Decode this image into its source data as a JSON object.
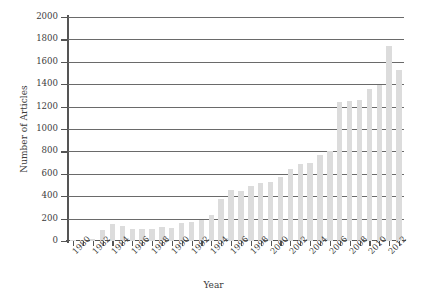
{
  "chart_data": {
    "type": "bar",
    "title": "",
    "xlabel": "Year",
    "ylabel": "Number of Articles",
    "categories": [
      1980,
      1981,
      1982,
      1983,
      1984,
      1985,
      1986,
      1987,
      1988,
      1989,
      1990,
      1991,
      1992,
      1993,
      1994,
      1995,
      1996,
      1997,
      1998,
      1999,
      2000,
      2001,
      2002,
      2003,
      2004,
      2005,
      2006,
      2007,
      2008,
      2009,
      2010,
      2011,
      2012,
      2013
    ],
    "values": [
      8,
      12,
      18,
      95,
      150,
      135,
      110,
      110,
      105,
      125,
      115,
      160,
      170,
      185,
      230,
      375,
      455,
      450,
      490,
      520,
      530,
      570,
      640,
      690,
      700,
      770,
      805,
      1245,
      1250,
      1255,
      1360,
      1395,
      1740,
      1530
    ],
    "xtick_labels": [
      "1980",
      "1982",
      "1984",
      "1986",
      "1988",
      "1990",
      "1992",
      "1994",
      "1996",
      "1998",
      "2000",
      "2002",
      "2004",
      "2006",
      "2008",
      "2010",
      "2012"
    ],
    "ytick_labels": [
      "0",
      "200",
      "400",
      "600",
      "800",
      "1000",
      "1200",
      "1400",
      "1600",
      "1800",
      "2000"
    ],
    "ylim": [
      0,
      2000
    ],
    "ytick_step": 200,
    "grid": true,
    "legend": "none",
    "bar_color": "#dcdcdc",
    "grid_color": "#6a6a6a",
    "axis_color": "#555555"
  }
}
